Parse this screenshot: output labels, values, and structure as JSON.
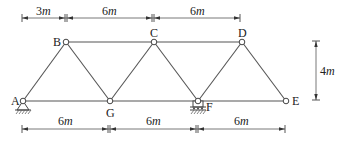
{
  "diagram": {
    "type": "truss",
    "nodes": [
      {
        "id": "A",
        "label": "A",
        "x": 0,
        "y": 0,
        "support": "pin"
      },
      {
        "id": "B",
        "label": "B",
        "x": 3,
        "y": 4
      },
      {
        "id": "C",
        "label": "C",
        "x": 9,
        "y": 4
      },
      {
        "id": "D",
        "label": "D",
        "x": 15,
        "y": 4
      },
      {
        "id": "G",
        "label": "G",
        "x": 6,
        "y": 0
      },
      {
        "id": "F",
        "label": "F",
        "x": 12,
        "y": 0,
        "support": "roller"
      },
      {
        "id": "E",
        "label": "E",
        "x": 18,
        "y": 0
      }
    ],
    "members": [
      [
        "A",
        "B"
      ],
      [
        "B",
        "C"
      ],
      [
        "C",
        "D"
      ],
      [
        "A",
        "G"
      ],
      [
        "G",
        "F"
      ],
      [
        "F",
        "E"
      ],
      [
        "B",
        "G"
      ],
      [
        "G",
        "C"
      ],
      [
        "C",
        "F"
      ],
      [
        "F",
        "D"
      ],
      [
        "D",
        "E"
      ]
    ],
    "labels": {
      "A": "A",
      "B": "B",
      "C": "C",
      "D": "D",
      "E": "E",
      "F": "F",
      "G": "G"
    },
    "dimensions": {
      "top": [
        "3m",
        "6m",
        "6m"
      ],
      "bottom": [
        "6m",
        "6m",
        "6m"
      ],
      "height": "4m"
    },
    "dimension_parts": {
      "top_0_num": "3",
      "top_1_num": "6",
      "top_2_num": "6",
      "bottom_0_num": "6",
      "bottom_1_num": "6",
      "bottom_2_num": "6",
      "height_num": "4",
      "unit": "m"
    }
  }
}
